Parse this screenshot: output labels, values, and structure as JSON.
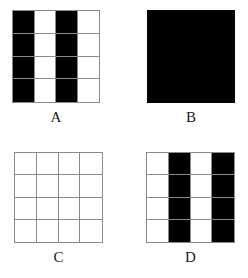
{
  "figure": {
    "title": "",
    "background_color": "#ffffff",
    "grid_line_color": "#8a8a8a",
    "fill_color": "#000000",
    "empty_color": "#ffffff",
    "label_color": "#1a1a1a"
  },
  "panels": [
    {
      "id": "A",
      "label": "A",
      "type": "grid",
      "rows": 4,
      "columns": 4,
      "description": "4x4 grid with vertical stripes: columns 1 and 3 filled black",
      "filled_columns": [
        1,
        3
      ],
      "cells": [
        [
          1,
          0,
          1,
          0
        ],
        [
          1,
          0,
          1,
          0
        ],
        [
          1,
          0,
          1,
          0
        ],
        [
          1,
          0,
          1,
          0
        ]
      ]
    },
    {
      "id": "B",
      "label": "B",
      "type": "solid",
      "rows": 4,
      "columns": 4,
      "description": "Solid black square, fully filled, no visible grid lines",
      "filled_columns": [
        1,
        2,
        3,
        4
      ],
      "cells": [
        [
          1,
          1,
          1,
          1
        ],
        [
          1,
          1,
          1,
          1
        ],
        [
          1,
          1,
          1,
          1
        ],
        [
          1,
          1,
          1,
          1
        ]
      ]
    },
    {
      "id": "C",
      "label": "C",
      "type": "grid",
      "rows": 4,
      "columns": 4,
      "description": "Empty 4x4 grid, all cells white",
      "filled_columns": [],
      "cells": [
        [
          0,
          0,
          0,
          0
        ],
        [
          0,
          0,
          0,
          0
        ],
        [
          0,
          0,
          0,
          0
        ],
        [
          0,
          0,
          0,
          0
        ]
      ]
    },
    {
      "id": "D",
      "label": "D",
      "type": "grid",
      "rows": 4,
      "columns": 4,
      "description": "4x4 grid with vertical stripes: columns 2 and 4 filled black (inverse of A)",
      "filled_columns": [
        2,
        4
      ],
      "cells": [
        [
          0,
          1,
          0,
          1
        ],
        [
          0,
          1,
          0,
          1
        ],
        [
          0,
          1,
          0,
          1
        ],
        [
          0,
          1,
          0,
          1
        ]
      ]
    }
  ]
}
